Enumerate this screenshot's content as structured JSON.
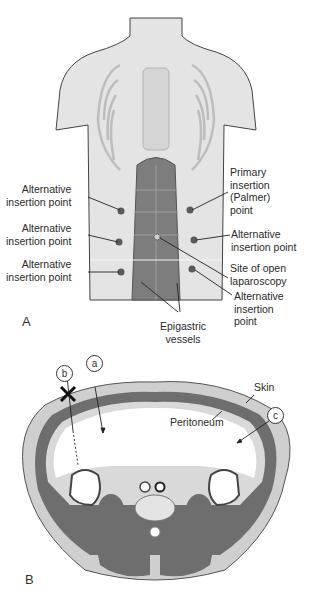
{
  "figure": {
    "panel_a": {
      "letter": "A",
      "labels": {
        "alt1": [
          "Alternative",
          "insertion point"
        ],
        "alt2": [
          "Alternative",
          "insertion point"
        ],
        "alt3": [
          "Alternative",
          "insertion point"
        ],
        "primary": [
          "Primary",
          "insertion",
          "(Palmer)",
          "point"
        ],
        "alt_right_mid": [
          "Alternative",
          "insertion point"
        ],
        "open_site": [
          "Site of open",
          "laparoscopy"
        ],
        "alt_right_low": [
          "Alternative",
          "insertion",
          "point"
        ],
        "epigastric": [
          "Epigastric",
          "vessels"
        ]
      },
      "colors": {
        "skin": "#dcdcdc",
        "outline": "#3a3a3a",
        "rectus": "#7d7d7d",
        "dot": "#5a5a5a"
      }
    },
    "panel_b": {
      "letter": "B",
      "markers": {
        "a": "a",
        "b": "b",
        "c": "c"
      },
      "labels": {
        "skin": "Skin",
        "peritoneum": "Peritoneum"
      },
      "colors": {
        "muscle": "#6e6e6e",
        "tissue": "#cfcfcf",
        "cavity": "#ffffff",
        "x_mark": "#111111"
      }
    }
  }
}
